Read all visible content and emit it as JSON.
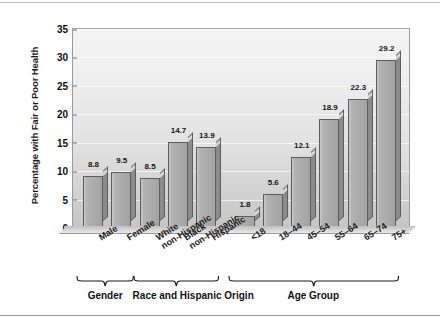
{
  "chart_data": {
    "type": "bar",
    "title": "",
    "xlabel": "",
    "ylabel": "Percentage with Fair or Poor Health",
    "ylim": [
      0,
      35
    ],
    "yticks": [
      0,
      5,
      10,
      15,
      20,
      25,
      30,
      35
    ],
    "grid": true,
    "legend": "none",
    "categories": [
      "Male",
      "Female",
      "White non-Hispanic",
      "Black non-Hispanic",
      "Hispanic",
      "<18",
      "18–44",
      "45–54",
      "55–64",
      "65–74",
      "75+"
    ],
    "category_lines": [
      [
        "Male"
      ],
      [
        "Female"
      ],
      [
        "White",
        "non-Hispanic"
      ],
      [
        "Black",
        "non-Hispanic"
      ],
      [
        "Hispanic"
      ],
      [
        "<18"
      ],
      [
        "18–44"
      ],
      [
        "45–54"
      ],
      [
        "55–64"
      ],
      [
        "65–74"
      ],
      [
        "75+"
      ]
    ],
    "values": [
      8.8,
      9.5,
      8.5,
      14.7,
      13.9,
      1.8,
      5.6,
      12.1,
      18.9,
      22.3,
      29.2
    ],
    "value_labels": [
      "8.8",
      "9.5",
      "8.5",
      "14.7",
      "13.9",
      "1.8",
      "5.6",
      "12.1",
      "18.9",
      "22.3",
      "29.2"
    ],
    "groups": [
      {
        "label": "Gender",
        "start": 0,
        "end": 1
      },
      {
        "label": "Race and Hispanic Origin",
        "start": 2,
        "end": 4
      },
      {
        "label": "Age Group",
        "start": 5,
        "end": 10
      }
    ],
    "colors": {
      "bar_face": "#ababab",
      "bar_side": "#8b8b8b",
      "bar_top": "#d7d7d7",
      "bar_outline": "#5d5d5d",
      "plot_background_top": "#f4f4f4",
      "plot_background_bottom": "#c6c6c6",
      "gridline": "#ffffff",
      "text": "#1a1a1a"
    }
  }
}
